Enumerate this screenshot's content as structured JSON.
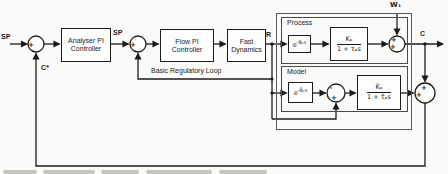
{
  "figure": {
    "signals": {
      "sp_outer": "SP",
      "sp_inner": "SP",
      "c_star": "C*",
      "r": "R",
      "w1": "W₁",
      "c": "C"
    },
    "blocks": {
      "analyser": "Analyser PI\nController",
      "flow": "Flow PI\nController",
      "fast": "Fast\nDynamics",
      "process_delay_base": "e",
      "process_delay_exp": "-θₚs",
      "process_tf_num": "Kₚ",
      "process_tf_den": "1 + τₚs",
      "model_delay_base": "e",
      "model_delay_exp": "-θ̂ₚs",
      "model_tf_num": "K̂ₚ",
      "model_tf_den": "1 + τ̂ₚs"
    },
    "sections": {
      "process": "Process",
      "model": "Model"
    },
    "loop_label": "Basic Regulatory Loop",
    "signs": {
      "j1_in": "+",
      "j1_fb": "-",
      "j2_in": "+",
      "j2_fb": "-",
      "w1_top": "+",
      "w1_left": "+",
      "inner_delay": "-",
      "inner_bypass": "+",
      "outer_top": "+",
      "outer_left": "+"
    },
    "colors": {
      "ink": "#1c1c1c",
      "paper": "#fafaf8"
    }
  }
}
